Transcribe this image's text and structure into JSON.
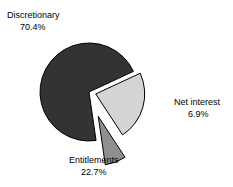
{
  "chart_data": {
    "type": "pie",
    "title": "",
    "subtitle": "",
    "xlabel": "",
    "ylabel": "",
    "grid": false,
    "legend_position": "none",
    "label_style": "outside-callout",
    "units": "percent",
    "categories": [
      "Discretionary",
      "Entitlements",
      "Net interest"
    ],
    "values": [
      70.4,
      22.7,
      6.9
    ],
    "value_labels": [
      "70.4%",
      "22.7%",
      "6.9%"
    ],
    "total": 100.0,
    "slices": [
      {
        "name": "Discretionary",
        "value": 70.4,
        "value_label": "70.4%",
        "color": "#333333",
        "exploded": false,
        "explode_offset": 0,
        "start_angle_deg": 81.7,
        "end_angle_deg": 335.1,
        "label_position": "top-left"
      },
      {
        "name": "Entitlements",
        "value": 22.7,
        "value_label": "22.7%",
        "color": "#d4d4d4",
        "exploded": true,
        "explode_offset": 7,
        "start_angle_deg": 335.1,
        "end_angle_deg": 416.8,
        "label_position": "bottom-center"
      },
      {
        "name": "Net interest",
        "value": 6.9,
        "value_label": "6.9%",
        "color": "#8f8f8f",
        "exploded": true,
        "explode_offset": 26,
        "start_angle_deg": 56.8,
        "end_angle_deg": 81.7,
        "label_position": "right"
      }
    ],
    "geometry": {
      "center_x": 89,
      "center_y": 92,
      "radius": 49
    },
    "style": {
      "background": "#ffffff",
      "outline_color": "#000000",
      "outline_width": 1,
      "text_color": "#000000"
    }
  }
}
